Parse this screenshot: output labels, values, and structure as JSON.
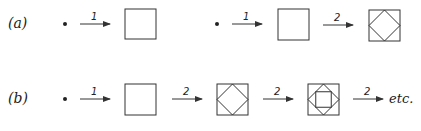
{
  "rows": [
    {
      "label": "(a)",
      "description": "Two sequences: point via rule 1 to square; point via rule 1 to square, then rule 2 to square with inscribed diamond",
      "arrows": [
        "1",
        "1",
        "2"
      ]
    },
    {
      "label": "(b)",
      "description": "Point via rule 1 to square, rule 2 repeatedly inscribes squares",
      "arrows": [
        "1",
        "2",
        "2",
        "2"
      ],
      "trailing_text": "etc."
    }
  ],
  "colors": {
    "stroke": "#333333",
    "text": "#1a1a1a"
  }
}
